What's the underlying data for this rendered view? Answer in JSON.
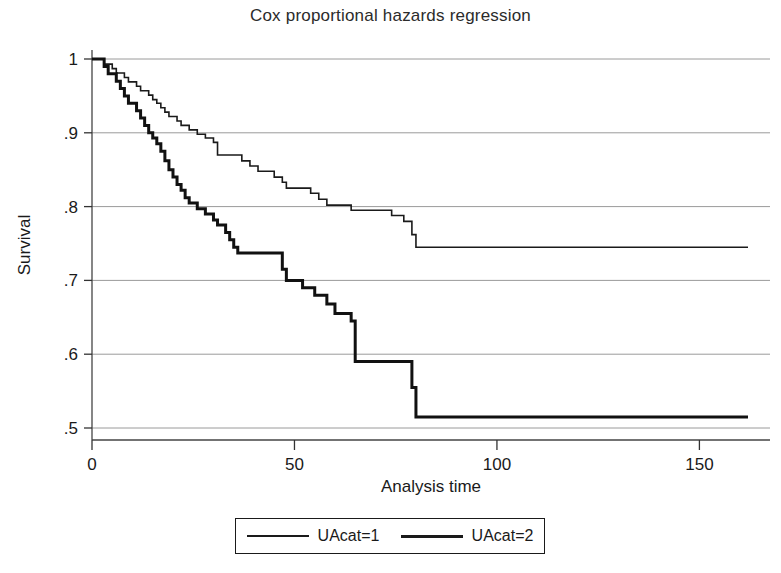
{
  "chart_data": {
    "type": "line",
    "title": "Cox proportional hazards regression",
    "xlabel": "Analysis time",
    "ylabel": "Survival",
    "xlim": [
      0,
      162
    ],
    "ylim": [
      0.47,
      1.0
    ],
    "xticks": [
      0,
      50,
      100,
      150
    ],
    "xtick_labels": [
      "0",
      "50",
      "100",
      "150"
    ],
    "yticks": [
      0.5,
      0.6,
      0.7,
      0.8,
      0.9,
      1.0
    ],
    "ytick_labels": [
      ".5",
      ".6",
      ".7",
      ".8",
      ".9",
      "1"
    ],
    "grid": "horizontal",
    "legend_position": "bottom",
    "step_style": "post",
    "series": [
      {
        "name": "UAcat=1",
        "line_width": 1.6,
        "color": "#1a1a1a",
        "points": [
          [
            0,
            1.0
          ],
          [
            2,
            1.0
          ],
          [
            3,
            0.993
          ],
          [
            5,
            0.987
          ],
          [
            6,
            0.981
          ],
          [
            8,
            0.975
          ],
          [
            9,
            0.969
          ],
          [
            11,
            0.963
          ],
          [
            12,
            0.957
          ],
          [
            14,
            0.951
          ],
          [
            15,
            0.945
          ],
          [
            16,
            0.94
          ],
          [
            17,
            0.934
          ],
          [
            18,
            0.928
          ],
          [
            19,
            0.922
          ],
          [
            21,
            0.916
          ],
          [
            22,
            0.91
          ],
          [
            24,
            0.904
          ],
          [
            26,
            0.898
          ],
          [
            28,
            0.893
          ],
          [
            30,
            0.887
          ],
          [
            31,
            0.87
          ],
          [
            36,
            0.87
          ],
          [
            37,
            0.862
          ],
          [
            39,
            0.855
          ],
          [
            41,
            0.848
          ],
          [
            43,
            0.848
          ],
          [
            45,
            0.84
          ],
          [
            47,
            0.833
          ],
          [
            48,
            0.825
          ],
          [
            52,
            0.825
          ],
          [
            54,
            0.818
          ],
          [
            56,
            0.81
          ],
          [
            58,
            0.802
          ],
          [
            62,
            0.802
          ],
          [
            64,
            0.795
          ],
          [
            70,
            0.795
          ],
          [
            74,
            0.788
          ],
          [
            77,
            0.78
          ],
          [
            79,
            0.762
          ],
          [
            80,
            0.745
          ],
          [
            162,
            0.745
          ]
        ]
      },
      {
        "name": "UAcat=2",
        "line_width": 3.0,
        "color": "#111111",
        "points": [
          [
            0,
            1.0
          ],
          [
            2,
            1.0
          ],
          [
            3,
            0.99
          ],
          [
            4,
            0.98
          ],
          [
            6,
            0.97
          ],
          [
            7,
            0.96
          ],
          [
            8,
            0.95
          ],
          [
            9,
            0.94
          ],
          [
            11,
            0.93
          ],
          [
            12,
            0.92
          ],
          [
            13,
            0.91
          ],
          [
            14,
            0.9
          ],
          [
            15,
            0.893
          ],
          [
            16,
            0.885
          ],
          [
            17,
            0.875
          ],
          [
            18,
            0.862
          ],
          [
            19,
            0.85
          ],
          [
            20,
            0.84
          ],
          [
            21,
            0.83
          ],
          [
            22,
            0.822
          ],
          [
            23,
            0.812
          ],
          [
            24,
            0.805
          ],
          [
            26,
            0.797
          ],
          [
            28,
            0.79
          ],
          [
            30,
            0.782
          ],
          [
            31,
            0.775
          ],
          [
            33,
            0.765
          ],
          [
            34,
            0.755
          ],
          [
            35,
            0.745
          ],
          [
            36,
            0.737
          ],
          [
            46,
            0.737
          ],
          [
            47,
            0.715
          ],
          [
            48,
            0.7
          ],
          [
            50,
            0.7
          ],
          [
            52,
            0.69
          ],
          [
            55,
            0.68
          ],
          [
            57,
            0.68
          ],
          [
            58,
            0.668
          ],
          [
            60,
            0.655
          ],
          [
            62,
            0.655
          ],
          [
            64,
            0.645
          ],
          [
            65,
            0.59
          ],
          [
            78,
            0.59
          ],
          [
            79,
            0.555
          ],
          [
            80,
            0.515
          ],
          [
            162,
            0.515
          ]
        ]
      }
    ]
  },
  "legend": {
    "entries": [
      {
        "label": "UAcat=1",
        "style": "thin"
      },
      {
        "label": "UAcat=2",
        "style": "thick"
      }
    ]
  }
}
